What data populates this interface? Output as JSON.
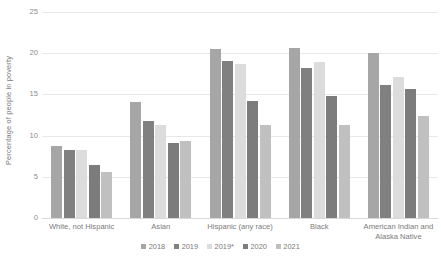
{
  "chart_data": {
    "type": "bar",
    "title": "",
    "subtitle": "",
    "xlabel": "",
    "ylabel": "Percentage of people in poverty",
    "ylim": [
      0,
      25
    ],
    "ytick_labels": [
      "0",
      "5",
      "10",
      "15",
      "20",
      "25"
    ],
    "ytick_values": [
      0,
      5,
      10,
      15,
      20,
      25
    ],
    "grid": true,
    "legend_position": "bottom-center",
    "categories": [
      "White, not Hispanic",
      "Asian",
      "Hispanic (any race)",
      "Black",
      "American Indian and Alaska Native"
    ],
    "category_lines": [
      [
        "White, not Hispanic"
      ],
      [
        "Asian"
      ],
      [
        "Hispanic (any race)"
      ],
      [
        "Black"
      ],
      [
        "American Indian and",
        "Alaska Native"
      ]
    ],
    "series": [
      {
        "name": "2018",
        "color": "#a6a6a6",
        "values": [
          8.7,
          14.1,
          20.5,
          20.6,
          20.0
        ]
      },
      {
        "name": "2019",
        "color": "#808080",
        "values": [
          8.2,
          11.8,
          19.0,
          18.2,
          16.1
        ]
      },
      {
        "name": "2019*",
        "color": "#dcdcdc",
        "values": [
          8.2,
          11.3,
          18.7,
          18.9,
          17.1
        ]
      },
      {
        "name": "2020",
        "color": "#7c7c7c",
        "values": [
          6.4,
          9.1,
          14.2,
          14.8,
          15.6
        ]
      },
      {
        "name": "2021",
        "color": "#c0c0c0",
        "values": [
          5.6,
          9.4,
          11.3,
          11.3,
          12.4
        ]
      }
    ],
    "colors": {
      "gridline": "#e8e8e8",
      "baseline": "#d9d9d9",
      "axis_text": "#7a7a7a",
      "tick_text": "#8c8c8c",
      "background": "#ffffff"
    }
  }
}
